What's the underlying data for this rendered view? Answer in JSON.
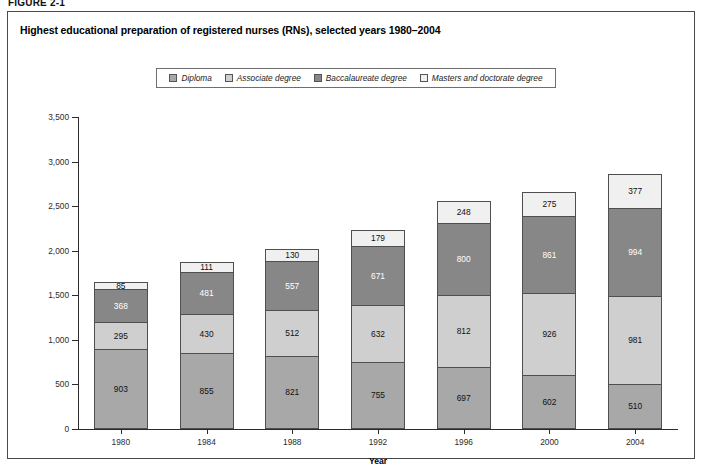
{
  "figure": {
    "label": "FIGURE 2-1"
  },
  "chart": {
    "title": "Highest educational preparation of registered nurses (RNs), selected years 1980–2004"
  },
  "legend": {
    "items": [
      {
        "label": "Diploma",
        "color": "#a8a8a8",
        "swatch_name": "legend-swatch-diploma"
      },
      {
        "label": "Associate degree",
        "color": "#cfcfcf",
        "swatch_name": "legend-swatch-associate"
      },
      {
        "label": "Baccalaureate degree",
        "color": "#878787",
        "swatch_name": "legend-swatch-baccalaureate"
      },
      {
        "label": "Masters and doctorate degree",
        "color": "#f0f0f0",
        "swatch_name": "legend-swatch-masters"
      }
    ]
  },
  "chart_data": {
    "type": "bar",
    "stacked": true,
    "title": "Highest educational preparation of registered nurses (RNs), selected years 1980–2004",
    "xlabel": "Year",
    "ylabel": "Thousands",
    "ylim": [
      0,
      3500
    ],
    "ytick_step": 500,
    "ytick_labels": [
      "0",
      "500",
      "1,000",
      "1,500",
      "2,000",
      "2,500",
      "3,000",
      "3,500"
    ],
    "yticks": [
      0,
      500,
      1000,
      1500,
      2000,
      2500,
      3000,
      3500
    ],
    "grid": false,
    "legend_position": "top",
    "categories": [
      "1980",
      "1984",
      "1988",
      "1992",
      "1996",
      "2000",
      "2004"
    ],
    "series": [
      {
        "name": "Diploma",
        "color": "#a8a8a8",
        "label_color": "dark",
        "values": [
          903,
          855,
          821,
          755,
          697,
          602,
          510
        ]
      },
      {
        "name": "Associate degree",
        "color": "#cfcfcf",
        "label_color": "dark",
        "values": [
          295,
          430,
          512,
          632,
          812,
          926,
          981
        ]
      },
      {
        "name": "Baccalaureate degree",
        "color": "#878787",
        "label_color": "light",
        "values": [
          368,
          481,
          557,
          671,
          800,
          861,
          994
        ]
      },
      {
        "name": "Masters and doctorate degree",
        "color": "#f0f0f0",
        "label_color": "dark",
        "values": [
          85,
          111,
          130,
          179,
          248,
          275,
          377
        ]
      }
    ],
    "totals": [
      1651,
      1877,
      2020,
      2237,
      2557,
      2664,
      2862
    ]
  }
}
